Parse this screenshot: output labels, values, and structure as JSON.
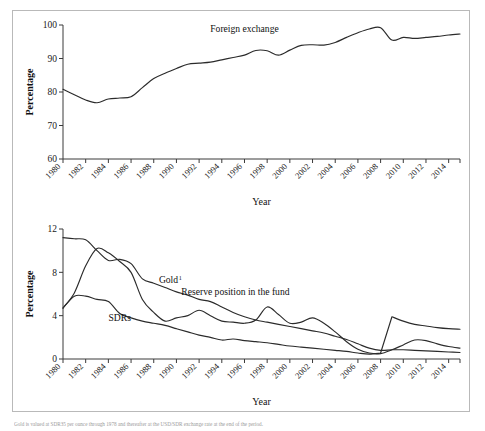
{
  "figure": {
    "footnote": "Gold is valued at SDR35 per ounce through 1978 and thereafter at the USD/SDR exchange rate at the end of the period."
  },
  "chart_data": [
    {
      "type": "line",
      "title": "",
      "xlabel": "Year",
      "ylabel": "Percentage",
      "ylim": [
        60,
        100
      ],
      "yticks": [
        60,
        70,
        80,
        90,
        100
      ],
      "xlim": [
        1980,
        2015
      ],
      "xticks": [
        1980,
        1982,
        1984,
        1986,
        1988,
        1990,
        1992,
        1994,
        1996,
        1998,
        2000,
        2002,
        2004,
        2006,
        2008,
        2010,
        2012,
        2014
      ],
      "grid": false,
      "legend_position": "inline-annotation",
      "annotations": [
        {
          "text": "Foreign exchange",
          "x": 1996,
          "y": 98.0
        }
      ],
      "series": [
        {
          "name": "Foreign exchange",
          "x": [
            1980,
            1981,
            1982,
            1983,
            1984,
            1985,
            1986,
            1987,
            1988,
            1989,
            1990,
            1991,
            1992,
            1993,
            1994,
            1995,
            1996,
            1997,
            1998,
            1999,
            2000,
            2001,
            2002,
            2003,
            2004,
            2005,
            2006,
            2007,
            2008,
            2009,
            2010,
            2011,
            2012,
            2013,
            2014,
            2015
          ],
          "values": [
            80.8,
            79.2,
            77.6,
            76.8,
            77.9,
            78.2,
            78.6,
            81.3,
            84.0,
            85.6,
            87.0,
            88.3,
            88.6,
            88.9,
            89.6,
            90.3,
            91.0,
            92.4,
            92.3,
            91.0,
            92.5,
            93.9,
            94.1,
            94.0,
            94.8,
            96.3,
            97.7,
            98.8,
            99.2,
            95.5,
            96.3,
            96.0,
            96.3,
            96.6,
            97.0,
            97.3
          ]
        }
      ]
    },
    {
      "type": "line",
      "title": "",
      "xlabel": "Year",
      "ylabel": "Percentage",
      "ylim": [
        0,
        12
      ],
      "yticks": [
        0,
        4,
        8,
        12
      ],
      "xlim": [
        1980,
        2015
      ],
      "xticks": [
        1980,
        1982,
        1984,
        1986,
        1988,
        1990,
        1992,
        1994,
        1996,
        1998,
        2000,
        2002,
        2004,
        2006,
        2008,
        2010,
        2012,
        2014
      ],
      "grid": false,
      "legend_position": "inline-annotation",
      "annotations": [
        {
          "text": "Gold",
          "superscript": "1",
          "x": 1989.3,
          "y": 7.0
        },
        {
          "text": "SDRs",
          "x": 1985.0,
          "y": 3.5
        },
        {
          "text": "Reserve position in the fund",
          "x": 1995.2,
          "y": 5.9
        }
      ],
      "series": [
        {
          "name": "Gold",
          "x": [
            1980,
            1981,
            1982,
            1983,
            1984,
            1985,
            1986,
            1987,
            1988,
            1989,
            1990,
            1991,
            1992,
            1993,
            1994,
            1995,
            1996,
            1997,
            1998,
            1999,
            2000,
            2001,
            2002,
            2003,
            2004,
            2005,
            2006,
            2007,
            2008,
            2009,
            2010,
            2011,
            2012,
            2013,
            2014,
            2015
          ],
          "values": [
            11.2,
            11.1,
            11.0,
            10.0,
            9.1,
            9.2,
            8.8,
            7.4,
            7.0,
            6.6,
            6.2,
            5.9,
            5.5,
            5.3,
            4.8,
            4.3,
            3.9,
            3.6,
            3.4,
            3.2,
            3.0,
            2.8,
            2.6,
            2.4,
            2.1,
            1.8,
            1.4,
            1.0,
            0.8,
            0.85,
            0.85,
            0.8,
            0.75,
            0.7,
            0.65,
            0.6
          ]
        },
        {
          "name": "SDRs",
          "x": [
            1980,
            1981,
            1982,
            1983,
            1984,
            1985,
            1986,
            1987,
            1988,
            1989,
            1990,
            1991,
            1992,
            1993,
            1994,
            1995,
            1996,
            1997,
            1998,
            1999,
            2000,
            2001,
            2002,
            2003,
            2004,
            2005,
            2006,
            2007,
            2008,
            2009,
            2010,
            2011,
            2012,
            2013,
            2014,
            2015
          ],
          "values": [
            4.7,
            5.8,
            5.8,
            5.5,
            5.3,
            4.2,
            3.8,
            3.5,
            3.3,
            3.1,
            2.8,
            2.5,
            2.2,
            2.0,
            1.75,
            1.85,
            1.7,
            1.6,
            1.5,
            1.35,
            1.2,
            1.1,
            1.0,
            0.9,
            0.8,
            0.7,
            0.55,
            0.45,
            0.55,
            3.9,
            3.5,
            3.2,
            3.05,
            2.9,
            2.8,
            2.75
          ]
        },
        {
          "name": "Reserve position in the fund",
          "x": [
            1980,
            1981,
            1982,
            1983,
            1984,
            1985,
            1986,
            1987,
            1988,
            1989,
            1990,
            1991,
            1992,
            1993,
            1994,
            1995,
            1996,
            1997,
            1998,
            1999,
            2000,
            2001,
            2002,
            2003,
            2004,
            2005,
            2006,
            2007,
            2008,
            2009,
            2010,
            2011,
            2012,
            2013,
            2014,
            2015
          ],
          "values": [
            4.7,
            6.1,
            8.6,
            10.2,
            9.8,
            9.0,
            8.0,
            5.5,
            4.3,
            3.5,
            3.8,
            4.0,
            4.5,
            4.0,
            3.5,
            3.4,
            3.3,
            3.6,
            4.8,
            4.1,
            3.3,
            3.4,
            3.8,
            3.3,
            2.5,
            1.6,
            0.9,
            0.55,
            0.5,
            0.85,
            1.3,
            1.75,
            1.7,
            1.4,
            1.15,
            1.0
          ]
        }
      ]
    }
  ]
}
